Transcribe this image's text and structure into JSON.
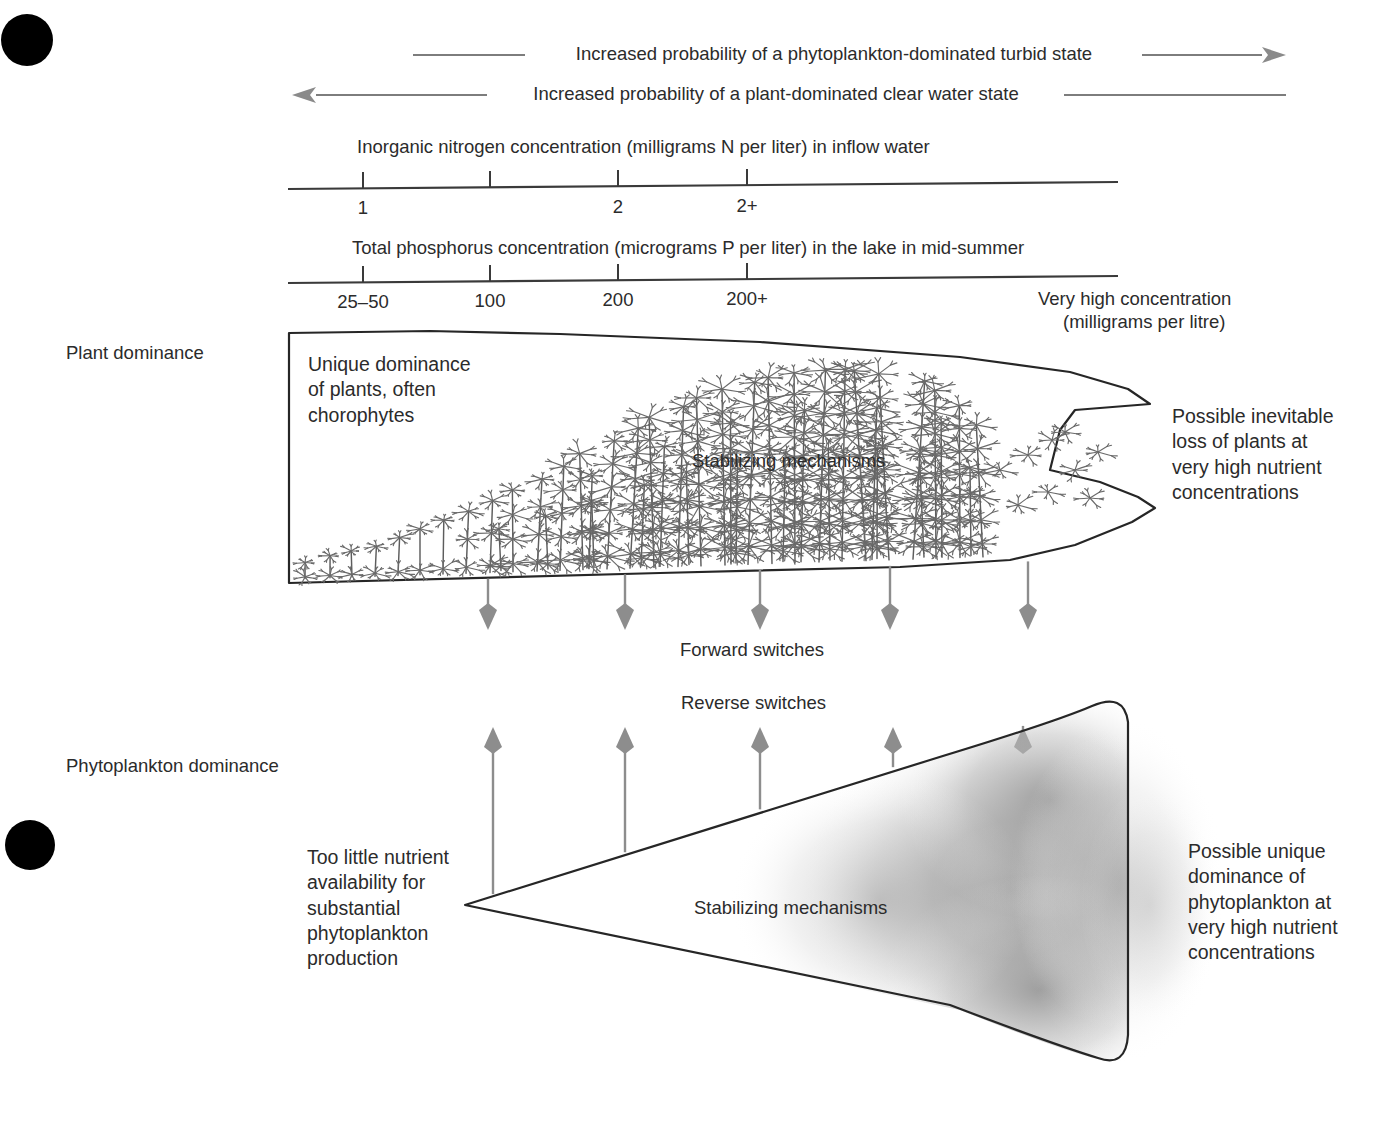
{
  "figure": {
    "type": "conceptual-diagram",
    "title_top_arrow": "Increased probability of a phytoplankton-dominated turbid state",
    "title_second_arrow": "Increased probability of a plant-dominated clear water state"
  },
  "axes": {
    "nitrogen": {
      "caption": "Inorganic nitrogen concentration (milligrams N per liter) in inflow water",
      "ticks": [
        {
          "label": "1",
          "x": 363
        },
        {
          "label": "",
          "x": 490
        },
        {
          "label": "2",
          "x": 618
        },
        {
          "label": "2+",
          "x": 747
        }
      ]
    },
    "phosphorus": {
      "caption": "Total phosphorus concentration (micrograms P per liter) in the lake in mid-summer",
      "ticks": [
        {
          "label": "25–50",
          "x": 363
        },
        {
          "label": "100",
          "x": 490
        },
        {
          "label": "200",
          "x": 618
        },
        {
          "label": "200+",
          "x": 747
        }
      ],
      "end_note_line1": "Very high concentration",
      "end_note_line2": "(milligrams per litre)"
    }
  },
  "labels": {
    "plant_dominance": "Plant dominance",
    "phytoplankton_dominance": "Phytoplankton dominance",
    "forward_switches": "Forward switches",
    "reverse_switches": "Reverse switches",
    "stabilizing_upper": "Stabilizing mechanisms",
    "stabilizing_lower": "Stabilizing mechanisms"
  },
  "annotations": {
    "unique_dominance": "Unique dominance\nof plants, often\nchorophytes",
    "possible_loss": "Possible inevitable\nloss of plants at\nvery high nutrient\nconcentrations",
    "too_little_nutrient": "Too little nutrient\navailability for\nsubstantial\nphytoplankton\nproduction",
    "possible_unique": "Possible unique\ndominance of\nphytoplankton at\nvery high nutrient\nconcentrations"
  },
  "switch_arrows": {
    "forward_x": [
      488,
      625,
      760,
      890,
      1028
    ],
    "reverse_x": [
      493,
      625,
      760,
      893,
      1023
    ]
  },
  "colors": {
    "ink": "#262626",
    "text": "#2b2b2b",
    "arrow_gray": "#8d8d8d",
    "plant_gray": "#6a6a6a",
    "cloud_gray": "#8a8a8a",
    "page_marker": "#000000"
  },
  "page_markers": [
    {
      "name": "top-left-dot",
      "cx": 27,
      "cy": 40,
      "r": 26
    },
    {
      "name": "mid-left-dot",
      "cx": 30,
      "cy": 845,
      "r": 25
    }
  ]
}
